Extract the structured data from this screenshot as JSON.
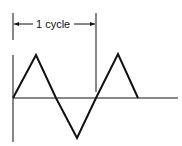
{
  "diagram": {
    "cycle_label": "1 cycle",
    "colors": {
      "stroke": "#111111",
      "background": "#ffffff"
    },
    "waveform": {
      "type": "triangle",
      "points": [
        [
          13,
          98
        ],
        [
          36,
          55
        ],
        [
          56,
          98
        ],
        [
          77,
          138
        ],
        [
          96,
          98
        ],
        [
          118,
          54
        ],
        [
          138,
          98
        ]
      ]
    },
    "axes": {
      "baseline": {
        "x1": 13,
        "x2": 178,
        "y": 98
      },
      "vertical": {
        "x": 13,
        "y1": 55,
        "y2": 142
      }
    },
    "cycle_marker": {
      "x_start": 13,
      "x_end": 96,
      "y": 24
    }
  }
}
